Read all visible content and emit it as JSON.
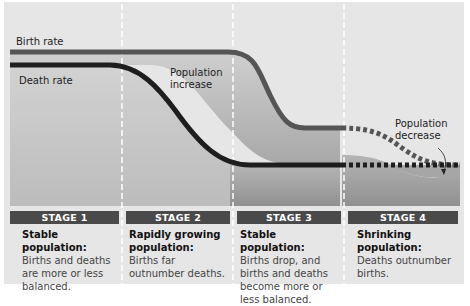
{
  "labels": {
    "birth_rate": "Birth rate",
    "death_rate": "Death rate",
    "pop_increase_1": "Population",
    "pop_increase_2": "increase",
    "pop_decrease_1": "Population",
    "pop_decrease_2": "decrease"
  },
  "stages": [
    {
      "label": "STAGE 1",
      "heading": "Stable population:",
      "text": "Births and deaths are more or less balanced."
    },
    {
      "label": "STAGE 2",
      "heading": "Rapidly growing population:",
      "text": "Births far outnumber deaths."
    },
    {
      "label": "STAGE 3",
      "heading": "Stable population:",
      "text": "Births drop, and births and deaths become more or less balanced."
    },
    {
      "label": "STAGE 4",
      "heading": "Shrinking population:",
      "text": "Deaths outnumber births."
    }
  ],
  "colors": {
    "background": "#e6e6e6",
    "birth_line": "#555555",
    "death_line": "#222222",
    "stage_bar": "#4a4a4a",
    "fill_dark": "#9a9a9a"
  }
}
